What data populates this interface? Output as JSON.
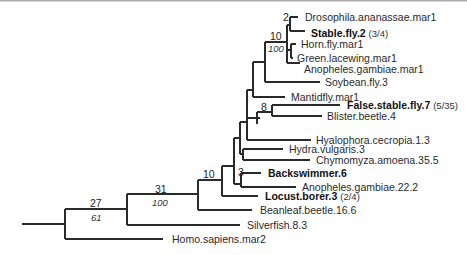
{
  "figure": {
    "type": "phylogenetic-tree",
    "leaves": [
      {
        "id": "drosophila",
        "label": "Drosophila.ananassae.mar1",
        "bold": false,
        "note": "",
        "x": 305,
        "y": 21
      },
      {
        "id": "stablefly",
        "label": "Stable.fly.2",
        "bold": true,
        "note": "(3/4)",
        "x": 311,
        "y": 37
      },
      {
        "id": "hornfly",
        "label": "Horn.fly.mar1",
        "bold": false,
        "note": "",
        "x": 301,
        "y": 46
      },
      {
        "id": "greenlacewing",
        "label": "Green.lacewing.mar1",
        "bold": false,
        "note": "",
        "x": 301,
        "y": 62
      },
      {
        "id": "anopheles1",
        "label": "Anopheles.gambiae.mar1",
        "bold": false,
        "note": "",
        "x": 307,
        "y": 73
      },
      {
        "id": "soybean",
        "label": "Soybean.fly.3",
        "bold": false,
        "note": "",
        "x": 326,
        "y": 87
      },
      {
        "id": "mantidfly",
        "label": "Mantidfly.mar1",
        "bold": false,
        "note": "",
        "x": 293,
        "y": 101
      },
      {
        "id": "falsestable",
        "label": "False.stable.fly.7",
        "bold": true,
        "note": "(5/35)",
        "x": 349,
        "y": 115
      },
      {
        "id": "blister",
        "label": "Blister.beetle.4",
        "bold": false,
        "note": "",
        "x": 330,
        "y": 130
      },
      {
        "id": "hyalophora",
        "label": "Hyalophora.cecropia.1.3",
        "bold": false,
        "note": "",
        "x": 318,
        "y": 145
      },
      {
        "id": "hydra",
        "label": "Hydra.vulgaris.3",
        "bold": false,
        "note": "",
        "x": 292,
        "y": 159
      },
      {
        "id": "chymomyza",
        "label": "Chymomyza.amoena.35.5",
        "bold": false,
        "note": "",
        "x": 318,
        "y": 173
      },
      {
        "id": "backswimmer",
        "label": "Backswimmer.6",
        "bold": true,
        "note": "",
        "x": 269,
        "y": 177
      },
      {
        "id": "anopheles2",
        "label": "Anopheles.gambiae.22.2",
        "bold": false,
        "note": "",
        "x": 302,
        "y": 191
      },
      {
        "id": "locust",
        "label": "Locust.borer.3",
        "bold": true,
        "note": "(2/4)",
        "x": 264,
        "y": 206
      },
      {
        "id": "beanleaf",
        "label": "Beanleaf.beetle.16.6",
        "bold": false,
        "note": "",
        "x": 260,
        "y": 221
      },
      {
        "id": "silverfish",
        "label": "Silverfish.8.3",
        "bold": false,
        "note": "",
        "x": 268,
        "y": 235
      },
      {
        "id": "homo",
        "label": "Homo.sapiens.mar2",
        "bold": false,
        "note": "",
        "x": 172,
        "y": 243
      }
    ],
    "support_labels": [
      {
        "node": "root-ingroup",
        "support": "27",
        "bootstrap": "61",
        "x": 97,
        "y": 205
      },
      {
        "node": "node-31",
        "support": "31",
        "bootstrap": "100",
        "x": 157,
        "y": 190
      },
      {
        "node": "node-10-lower",
        "support": "10",
        "bootstrap": "",
        "x": 207,
        "y": 174
      },
      {
        "node": "node-10-upper",
        "support": "10",
        "bootstrap": "100",
        "x": 267,
        "y": 38
      },
      {
        "node": "node-2",
        "support": "2",
        "bootstrap": "",
        "x": 283,
        "y": 19
      },
      {
        "node": "node-8",
        "support": "8",
        "bootstrap": "",
        "x": 264,
        "y": 113
      },
      {
        "node": "node-3",
        "support": "3",
        "bootstrap": "",
        "x": 239,
        "y": 176
      }
    ]
  }
}
